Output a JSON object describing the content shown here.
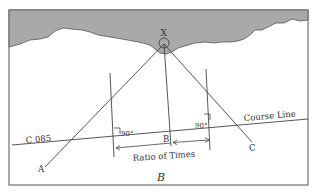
{
  "diagram": {
    "landmark_label": "X",
    "course_label": "C 085",
    "course_line_label": "Course Line",
    "point_a": "A",
    "point_b": "B",
    "point_c": "C",
    "angle_left": "90°",
    "angle_right": "90°",
    "ratio_label": "Ratio of Times",
    "figure_label": "B",
    "colors": {
      "land": "#a9a9a9",
      "line": "#444444",
      "frame": "#555555",
      "background": "#ffffff"
    }
  }
}
